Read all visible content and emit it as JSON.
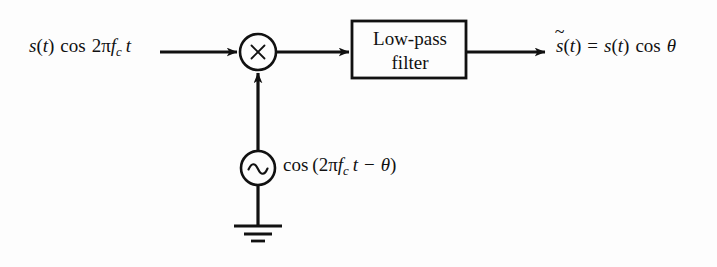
{
  "figure": {
    "kind": "signal-flow-block-diagram",
    "title_text": "",
    "background_color": "#fdfdfd",
    "stroke_color": "#111111"
  },
  "input": {
    "name": "input-signal-expression",
    "full_text": "s(t) cos 2πf_c t",
    "parts": {
      "signal": "s",
      "paren_open": "(",
      "time_var": "t",
      "paren_close": ")",
      "cos": "cos",
      "two": "2",
      "pi": "π",
      "f": "f",
      "subscript_c": "c",
      "t": "t"
    }
  },
  "multiplier": {
    "name": "multiplier-node",
    "glyph": "×",
    "center_x": 258,
    "center_y": 52,
    "radius": 18
  },
  "filter": {
    "name": "low-pass-filter-block",
    "line1": "Low-pass",
    "line2": "filter",
    "x": 352,
    "y": 21,
    "width": 114,
    "height": 57
  },
  "output": {
    "name": "output-signal-expression",
    "full_text": "s̃(t) = s(t) cos θ",
    "parts": {
      "s_tilde": "s",
      "tilde": "̃",
      "paren_open": "(",
      "time_var": "t",
      "paren_close": ")",
      "equals": "=",
      "signal": "s",
      "cos": "cos",
      "theta": "θ"
    }
  },
  "oscillator": {
    "name": "local-oscillator-source",
    "glyph": "∼",
    "center_x": 258,
    "center_y": 168,
    "radius": 17,
    "expression_full_text": "cos (2πf_c t − θ)",
    "expression_parts": {
      "cos": "cos",
      "paren_open": "(",
      "two": "2",
      "pi": "π",
      "f": "f",
      "subscript_c": "c",
      "t": "t",
      "minus": "−",
      "theta": "θ",
      "paren_close": ")"
    }
  },
  "ground": {
    "name": "ground-symbol",
    "bars": [
      48,
      28,
      14
    ],
    "stem_top_y": 185,
    "stem_bottom_y": 225
  },
  "connections": [
    {
      "name": "input-to-multiplier-arrow",
      "from_x": 160,
      "from_y": 52,
      "to_x": 239,
      "to_y": 52,
      "direction": "right"
    },
    {
      "name": "multiplier-to-filter-arrow",
      "from_x": 277,
      "from_y": 52,
      "to_x": 351,
      "to_y": 52,
      "direction": "right"
    },
    {
      "name": "filter-to-output-arrow",
      "from_x": 466,
      "from_y": 52,
      "to_x": 547,
      "to_y": 52,
      "direction": "right"
    },
    {
      "name": "oscillator-to-multiplier-arrow",
      "from_x": 258,
      "from_y": 151,
      "to_x": 258,
      "to_y": 71,
      "direction": "up"
    },
    {
      "name": "oscillator-to-ground-line",
      "from_x": 258,
      "from_y": 185,
      "to_x": 258,
      "to_y": 225,
      "direction": "down"
    }
  ]
}
